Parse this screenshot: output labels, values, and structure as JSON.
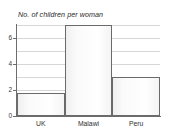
{
  "chart_data": {
    "type": "bar",
    "title": "No. of children per woman",
    "xlabel": "",
    "ylabel": "",
    "categories": [
      "UK",
      "Malawi",
      "Peru"
    ],
    "values": [
      1.8,
      7.0,
      3.0
    ],
    "ylim": [
      0,
      7
    ],
    "ytick_labels": [
      "0",
      "2",
      "4",
      "6"
    ],
    "ytick_values": [
      0,
      2,
      4,
      6
    ],
    "gridline_values": [
      1,
      2,
      3,
      4,
      5,
      6,
      7
    ],
    "grid": true,
    "legend": "none",
    "colors": {
      "bar_fill": "#fbfbfb",
      "bar_border": "#6a6a6a",
      "gridline": "#d6d6d6",
      "axis": "#6d6d6d",
      "text": "#2f2f2f",
      "background": "#ffffff"
    }
  }
}
